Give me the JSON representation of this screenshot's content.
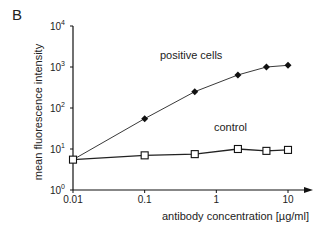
{
  "panel_label": "B",
  "chart_data": {
    "type": "line",
    "title": "",
    "xlabel": "antibody concentration [µg/ml]",
    "ylabel": "mean fluorescence intensity",
    "xscale": "log",
    "yscale": "log",
    "xlim": [
      0.01,
      10
    ],
    "ylim": [
      1,
      10000
    ],
    "grid": false,
    "x_ticks": [
      {
        "value": 0.01,
        "label": "0.01"
      },
      {
        "value": 0.1,
        "label": "0.1"
      },
      {
        "value": 1,
        "label": "1"
      },
      {
        "value": 10,
        "label": "10"
      }
    ],
    "y_ticks": [
      {
        "value": 1,
        "base": "10",
        "exp": "0"
      },
      {
        "value": 10,
        "base": "10",
        "exp": "1"
      },
      {
        "value": 100,
        "base": "10",
        "exp": "2"
      },
      {
        "value": 1000,
        "base": "10",
        "exp": "3"
      },
      {
        "value": 10000,
        "base": "10",
        "exp": "4"
      }
    ],
    "series": [
      {
        "name": "positive cells",
        "marker": "diamond-filled",
        "x": [
          0.01,
          0.1,
          0.5,
          2,
          5,
          10
        ],
        "y": [
          5.5,
          55,
          250,
          640,
          1000,
          1100
        ]
      },
      {
        "name": "control",
        "marker": "square-open",
        "x": [
          0.01,
          0.1,
          0.5,
          2,
          5,
          10
        ],
        "y": [
          5.5,
          7,
          7.5,
          10,
          9,
          9.5
        ]
      }
    ],
    "annotations": [
      {
        "text": "positive cells",
        "series": "positive cells"
      },
      {
        "text": "control",
        "series": "control"
      }
    ]
  }
}
